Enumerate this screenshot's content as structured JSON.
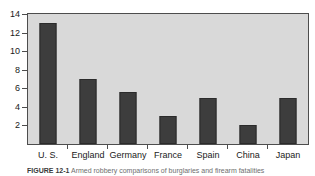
{
  "figure": {
    "caption_label": "FIGURE 12-1",
    "caption_text": "Armed robbery comparisons of burglaries and firearm fatalities"
  },
  "chart_data": {
    "type": "bar",
    "title": "",
    "xlabel": "",
    "ylabel": "",
    "categories": [
      "U. S.",
      "England",
      "Germany",
      "France",
      "Spain",
      "China",
      "Japan"
    ],
    "values": [
      13,
      7,
      5.6,
      3,
      5,
      2,
      5
    ],
    "ylim": [
      0,
      14
    ],
    "yticks": [
      2,
      4,
      6,
      8,
      10,
      12,
      14
    ],
    "ytick_labels": [
      "2",
      "4",
      "6",
      "8",
      "10",
      "12",
      "14"
    ],
    "grid": false,
    "legend": false,
    "bar_color": "#3d3d3d",
    "plot_background": "#d9d9d9",
    "axis_color": "#4d4d4d"
  }
}
